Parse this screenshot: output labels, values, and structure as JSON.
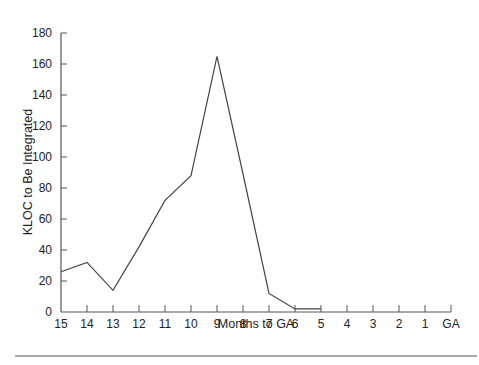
{
  "chart_data": {
    "type": "line",
    "title": "",
    "xlabel": "Months to GA",
    "ylabel": "KLOC to Be Integrated",
    "categories": [
      "15",
      "14",
      "13",
      "12",
      "11",
      "10",
      "9",
      "8",
      "7",
      "6",
      "5",
      "4",
      "3",
      "2",
      "1",
      "GA"
    ],
    "series": [
      {
        "name": "KLOC to Be Integrated",
        "x": [
          "15",
          "14",
          "13",
          "12",
          "11",
          "10",
          "9",
          "8",
          "7",
          "6",
          "5"
        ],
        "values": [
          26,
          32,
          14,
          42,
          72,
          88,
          165,
          89,
          12,
          2,
          2
        ]
      }
    ],
    "yticks": [
      0,
      20,
      40,
      60,
      80,
      100,
      120,
      140,
      160,
      180
    ],
    "ylim": [
      0,
      180
    ],
    "grid": false,
    "legend": "none",
    "line_color": "#444444"
  }
}
